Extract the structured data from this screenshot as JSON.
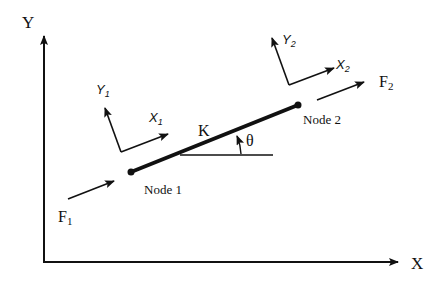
{
  "diagram": {
    "type": "truss-element-coordinate-systems",
    "global_axes": {
      "x_label": "X",
      "y_label": "Y"
    },
    "element": {
      "stiffness_label": "K",
      "angle_label": "θ",
      "node1_label": "Node 1",
      "node2_label": "Node 2"
    },
    "local_axes_node1": {
      "x_label": "X",
      "x_sub": "1",
      "y_label": "Y",
      "y_sub": "1"
    },
    "local_axes_node2": {
      "x_label": "X",
      "x_sub": "2",
      "y_label": "Y",
      "y_sub": "2"
    },
    "forces": {
      "f1_label": "F",
      "f1_sub": "1",
      "f2_label": "F",
      "f2_sub": "2"
    },
    "colors": {
      "line": "#111111",
      "background": "#ffffff"
    }
  }
}
